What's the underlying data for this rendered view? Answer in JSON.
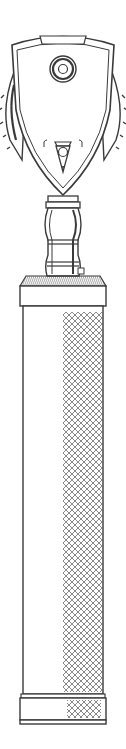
{
  "illustration": {
    "subject": "ophthalmoscope",
    "style": "line-drawing",
    "colors": {
      "background": "#ffffff",
      "ink": "#3a3a3a",
      "hatch": "#6a6a6a"
    },
    "parts": [
      "head",
      "viewing-aperture",
      "knurled-dial-left",
      "knurled-dial-right",
      "light-window",
      "neck",
      "handle-collar",
      "handle-body",
      "knurled-grip",
      "end-cap"
    ]
  }
}
